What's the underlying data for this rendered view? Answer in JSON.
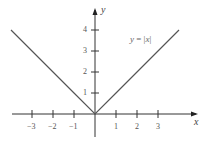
{
  "chart_data": {
    "type": "line",
    "title": "",
    "xlabel": "x",
    "ylabel": "y",
    "series": [
      {
        "name": "y = |x|",
        "x": [
          -4,
          -3,
          -2,
          -1,
          0,
          1,
          2,
          3,
          4
        ],
        "values": [
          4,
          3,
          2,
          1,
          0,
          1,
          2,
          3,
          4
        ]
      }
    ],
    "x_ticks": [
      "-3",
      "-2",
      "-1",
      "1",
      "2",
      "3"
    ],
    "y_ticks": [
      "1",
      "2",
      "3",
      "4"
    ],
    "xlim": [
      -4.5,
      4.7
    ],
    "ylim": [
      -1,
      5
    ],
    "grid": false,
    "legend": "inline annotation near upper right line",
    "annotation": "y = |x|",
    "colors": {
      "curve": "#555555",
      "axis": "#333333"
    }
  },
  "labels": {
    "x_axis": "x",
    "y_axis": "y",
    "function_lhs": "y",
    "function_eq": "=",
    "function_var": "x"
  }
}
